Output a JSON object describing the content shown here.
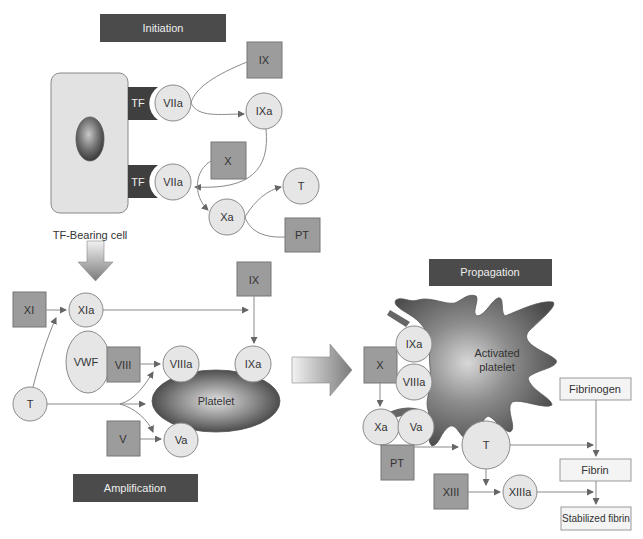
{
  "phases": {
    "initiation": "Initiation",
    "amplification": "Amplification",
    "propagation": "Propagation"
  },
  "initiation": {
    "cell_label": "TF-Bearing cell",
    "tf_top": "TF",
    "tf_bottom": "TF",
    "viia_top": "VIIa",
    "viia_bottom": "VIIa",
    "ix": "IX",
    "ixa": "IXa",
    "x": "X",
    "xa": "Xa",
    "t": "T",
    "pt": "PT"
  },
  "amplification": {
    "xi": "XI",
    "xia": "XIa",
    "ix": "IX",
    "vwf": "VWF",
    "viii": "VIII",
    "viiia": "VIIIa",
    "ixa": "IXa",
    "platelet": "Platelet",
    "t": "T",
    "v": "V",
    "va": "Va"
  },
  "propagation": {
    "activated_platelet_line1": "Activated",
    "activated_platelet_line2": "platelet",
    "ixa": "IXa",
    "viiia": "VIIIa",
    "x": "X",
    "xa": "Xa",
    "va": "Va",
    "pt": "PT",
    "t": "T",
    "xiii": "XIII",
    "xiiia": "XIIIa",
    "fibrinogen": "Fibrinogen",
    "fibrin": "Fibrin",
    "stabilized_fibrin": "Stabilized fibrin"
  },
  "colors": {
    "bar": "#4b4b4b",
    "circle_fill": "#e6e6e6",
    "box_fill": "#9c9c9c",
    "platelet": "#5a5a5a"
  }
}
